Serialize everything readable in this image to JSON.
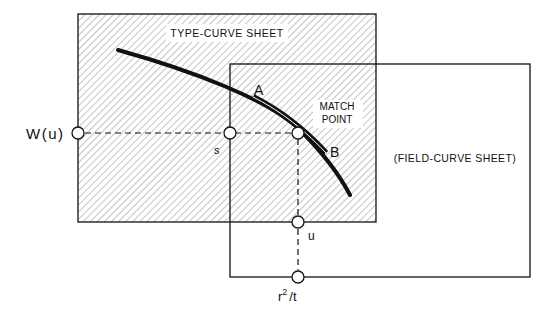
{
  "diagram": {
    "type_curve_sheet": {
      "label": "TYPE-CURVE SHEET"
    },
    "field_curve_sheet": {
      "label": "(FIELD-CURVE SHEET)"
    },
    "match_point": {
      "label_line1": "MATCH",
      "label_line2": "POINT"
    },
    "points": {
      "a": "A",
      "b": "B",
      "s": "s",
      "u": "u"
    },
    "axes": {
      "w_u": "W(u)",
      "r2": "r",
      "r2_sup": "2",
      "r2_rest": "/t"
    }
  },
  "colors": {
    "ink": "#111111",
    "paper": "#ffffff",
    "hatch": "#8a8a8a"
  }
}
